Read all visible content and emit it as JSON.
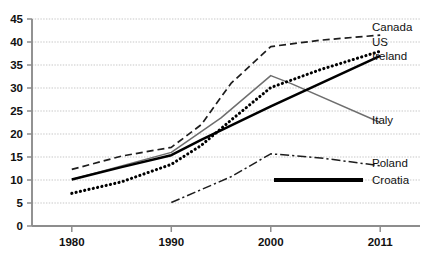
{
  "chart_data": {
    "type": "line",
    "title": "",
    "xlabel": "",
    "ylabel": "",
    "x": [
      1980,
      1990,
      2000,
      2011
    ],
    "xticks": [
      "1980",
      "1990",
      "2000",
      "2011"
    ],
    "yticks": [
      "0",
      "5",
      "10",
      "15",
      "20",
      "25",
      "30",
      "35",
      "40",
      "45"
    ],
    "ylim": [
      0,
      45
    ],
    "xlim": [
      1976,
      2015
    ],
    "grid": "horizontal-dotted",
    "legend": "inline-right-labels",
    "series": [
      {
        "name": "Canada",
        "style": "dashed",
        "color": "#1d1d1d",
        "label_value": "Canada",
        "points": [
          [
            1980,
            12.3
          ],
          [
            1985,
            15.2
          ],
          [
            1990,
            17.1
          ],
          [
            1993,
            22.0
          ],
          [
            1996,
            31.0
          ],
          [
            2000,
            39.0
          ],
          [
            2005,
            40.4
          ],
          [
            2011,
            41.5
          ]
        ]
      },
      {
        "name": "Italy",
        "style": "thin-solid-gray",
        "color": "#6e6e6e",
        "label_value": "Italy",
        "points": [
          [
            1980,
            10.1
          ],
          [
            1990,
            16.0
          ],
          [
            1995,
            23.5
          ],
          [
            2000,
            32.7
          ],
          [
            2002,
            31.0
          ],
          [
            2011,
            22.5
          ]
        ]
      },
      {
        "name": "Ireland",
        "style": "thick-solid-black",
        "color": "#000000",
        "label_value": "Ireland",
        "points": [
          [
            1980,
            10.1
          ],
          [
            1985,
            12.8
          ],
          [
            1990,
            15.4
          ],
          [
            1993,
            18.7
          ],
          [
            2000,
            26.0
          ],
          [
            2011,
            37.0
          ]
        ]
      },
      {
        "name": "US",
        "style": "dotted",
        "color": "#000000",
        "label_value": "US",
        "points": [
          [
            1980,
            7.1
          ],
          [
            1985,
            9.6
          ],
          [
            1990,
            13.4
          ],
          [
            1993,
            17.5
          ],
          [
            1996,
            23.0
          ],
          [
            2000,
            30.1
          ],
          [
            2005,
            34.0
          ],
          [
            2011,
            38.0
          ]
        ]
      },
      {
        "name": "Poland",
        "style": "dash-dot",
        "color": "#1d1d1d",
        "label_value": "Poland",
        "points": [
          [
            1990,
            5.1
          ],
          [
            1996,
            10.7
          ],
          [
            2000,
            15.7
          ],
          [
            2005,
            14.8
          ],
          [
            2011,
            13.1
          ]
        ]
      },
      {
        "name": "Croatia",
        "style": "thick-solid-black-legend-only",
        "color": "#000000",
        "label_value": "Croatia",
        "points": []
      }
    ],
    "series_labels": [
      {
        "text": "Canada",
        "x": 372,
        "y": 31
      },
      {
        "text": "US",
        "x": 372,
        "y": 46
      },
      {
        "text": "Ireland",
        "x": 372,
        "y": 60
      },
      {
        "text": "Italy",
        "x": 372,
        "y": 124
      },
      {
        "text": "Poland",
        "x": 372,
        "y": 167
      },
      {
        "text": "Croatia",
        "x": 372,
        "y": 184
      }
    ]
  }
}
